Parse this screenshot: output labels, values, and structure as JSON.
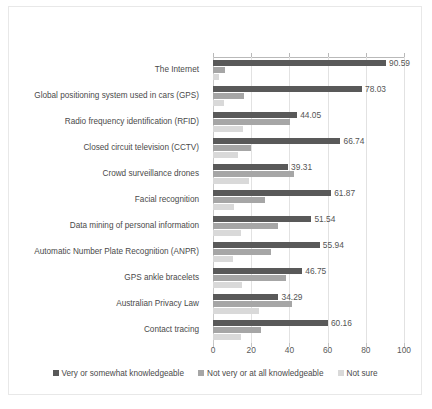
{
  "chart_data": {
    "type": "bar",
    "orientation": "horizontal",
    "title": "",
    "xlabel": "",
    "ylabel": "",
    "xlim": [
      0,
      100
    ],
    "xticks": [
      0,
      20,
      40,
      60,
      80,
      100
    ],
    "grid": true,
    "legend_position": "bottom",
    "categories": [
      "The Internet",
      "Global positioning system used in cars (GPS)",
      "Radio frequency identification (RFID)",
      "Closed circuit television (CCTV)",
      "Crowd surveillance drones",
      "Facial recognition",
      "Data mining of personal information",
      "Automatic Number Plate Recognition (ANPR)",
      "GPS ankle bracelets",
      "Australian Privacy Law",
      "Contact tracing"
    ],
    "series": [
      {
        "name": "Very or somewhat knowledgeable",
        "color": "#595959",
        "values": [
          90.59,
          78.03,
          44.05,
          66.74,
          39.31,
          61.87,
          51.54,
          55.94,
          46.75,
          34.29,
          60.16
        ],
        "labels": [
          "90.59",
          "78.03",
          "44.05",
          "66.74",
          "39.31",
          "61.87",
          "51.54",
          "55.94",
          "46.75",
          "34.29",
          "60.16"
        ]
      },
      {
        "name": "Not very or at all knowledgeable",
        "color": "#a6a6a6",
        "values": [
          6.2,
          16.4,
          40.2,
          20.1,
          42.3,
          27.2,
          34.1,
          30.2,
          38.1,
          41.6,
          25.3
        ],
        "labels": [
          "",
          "",
          "",
          "",
          "",
          "",
          "",
          "",
          "",
          "",
          ""
        ]
      },
      {
        "name": "Not sure",
        "color": "#d9d9d9",
        "values": [
          3.2,
          5.8,
          15.8,
          13.2,
          18.6,
          10.9,
          14.5,
          10.4,
          15.1,
          24.1,
          14.7
        ],
        "labels": [
          "",
          "",
          "",
          "",
          "",
          "",
          "",
          "",
          "",
          "",
          ""
        ]
      }
    ]
  },
  "legend": {
    "items": [
      {
        "label": "Very or somewhat knowledgeable"
      },
      {
        "label": "Not very or at all knowledgeable"
      },
      {
        "label": "Not sure"
      }
    ]
  }
}
